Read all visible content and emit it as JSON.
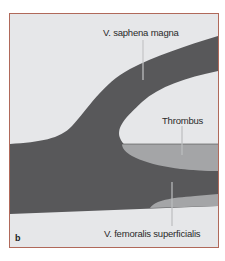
{
  "figure": {
    "panel_letter": "b",
    "labels": {
      "saphena": "V. saphena magna",
      "thrombus": "Thrombus",
      "femoralis": "V. femoralis superficialis"
    },
    "colors": {
      "background": "#e6e7e9",
      "vein": "#58585a",
      "thrombus": "#a4a5a7",
      "border": "#b0695a",
      "leader_line": "#bdbec0"
    }
  }
}
